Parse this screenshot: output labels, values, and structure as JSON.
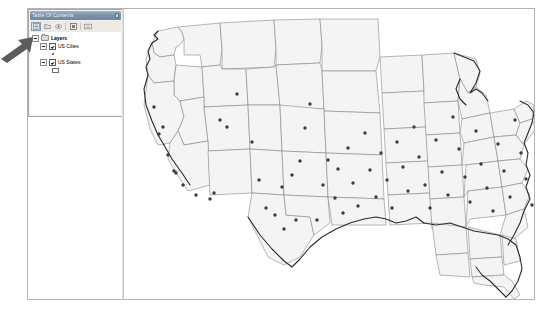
{
  "app": {
    "panel_title": "Table Of Contents"
  },
  "toolbar": {
    "buttons": [
      {
        "name": "list-by-drawing-order",
        "icon": "drawing-order-icon",
        "pressed": true
      },
      {
        "name": "list-by-source",
        "icon": "source-icon",
        "pressed": false
      },
      {
        "name": "list-by-visibility",
        "icon": "visibility-icon",
        "pressed": false
      },
      {
        "name": "list-by-selection",
        "icon": "selection-icon",
        "pressed": false
      },
      {
        "name": "options",
        "icon": "options-icon",
        "pressed": false
      }
    ]
  },
  "toc": {
    "root": {
      "label": "Layers",
      "expanded": true,
      "icon": "folder-icon"
    },
    "layers": [
      {
        "label": "US Cities",
        "checked": true,
        "expanded": true,
        "symbol": "point",
        "symbol_name": "point-symbol"
      },
      {
        "label": "US States",
        "checked": true,
        "expanded": true,
        "symbol": "polygon",
        "symbol_name": "polygon-symbol"
      }
    ]
  },
  "annotation": {
    "arrow_name": "pointer-arrow-annotation",
    "color": "#5c5c5c",
    "points_to": "US Cities expander"
  },
  "map": {
    "name": "us-map",
    "state_fill": "#f4f4f4",
    "state_stroke": "#7d7d7d",
    "coast_stroke": "#2b2b2b",
    "city_color": "#3d3d3d",
    "background": "#ffffff",
    "cities": [
      [
        39,
        118
      ],
      [
        35,
        125
      ],
      [
        30,
        98
      ],
      [
        44,
        146
      ],
      [
        50,
        162
      ],
      [
        52,
        164
      ],
      [
        59,
        176
      ],
      [
        72,
        186
      ],
      [
        90,
        184
      ],
      [
        86,
        190
      ],
      [
        96,
        111
      ],
      [
        103,
        118
      ],
      [
        113,
        85
      ],
      [
        128,
        133
      ],
      [
        135,
        171
      ],
      [
        142,
        199
      ],
      [
        151,
        206
      ],
      [
        158,
        178
      ],
      [
        160,
        220
      ],
      [
        168,
        166
      ],
      [
        172,
        211
      ],
      [
        176,
        152
      ],
      [
        181,
        119
      ],
      [
        186,
        95
      ],
      [
        193,
        211
      ],
      [
        199,
        176
      ],
      [
        204,
        151
      ],
      [
        211,
        189
      ],
      [
        214,
        160
      ],
      [
        219,
        204
      ],
      [
        224,
        139
      ],
      [
        229,
        174
      ],
      [
        234,
        197
      ],
      [
        241,
        124
      ],
      [
        246,
        161
      ],
      [
        252,
        188
      ],
      [
        257,
        144
      ],
      [
        263,
        171
      ],
      [
        268,
        199
      ],
      [
        273,
        133
      ],
      [
        279,
        158
      ],
      [
        284,
        182
      ],
      [
        290,
        118
      ],
      [
        295,
        148
      ],
      [
        301,
        176
      ],
      [
        306,
        199
      ],
      [
        312,
        131
      ],
      [
        318,
        163
      ],
      [
        324,
        186
      ],
      [
        329,
        108
      ],
      [
        335,
        140
      ],
      [
        341,
        168
      ],
      [
        346,
        193
      ],
      [
        352,
        122
      ],
      [
        357,
        155
      ],
      [
        363,
        179
      ],
      [
        369,
        202
      ],
      [
        374,
        135
      ],
      [
        380,
        162
      ],
      [
        386,
        188
      ],
      [
        391,
        111
      ],
      [
        397,
        144
      ],
      [
        402,
        170
      ],
      [
        408,
        196
      ],
      [
        413,
        127
      ],
      [
        419,
        157
      ],
      [
        424,
        182
      ],
      [
        430,
        103
      ],
      [
        435,
        139
      ],
      [
        441,
        166
      ],
      [
        446,
        190
      ],
      [
        452,
        120
      ],
      [
        457,
        151
      ]
    ]
  }
}
